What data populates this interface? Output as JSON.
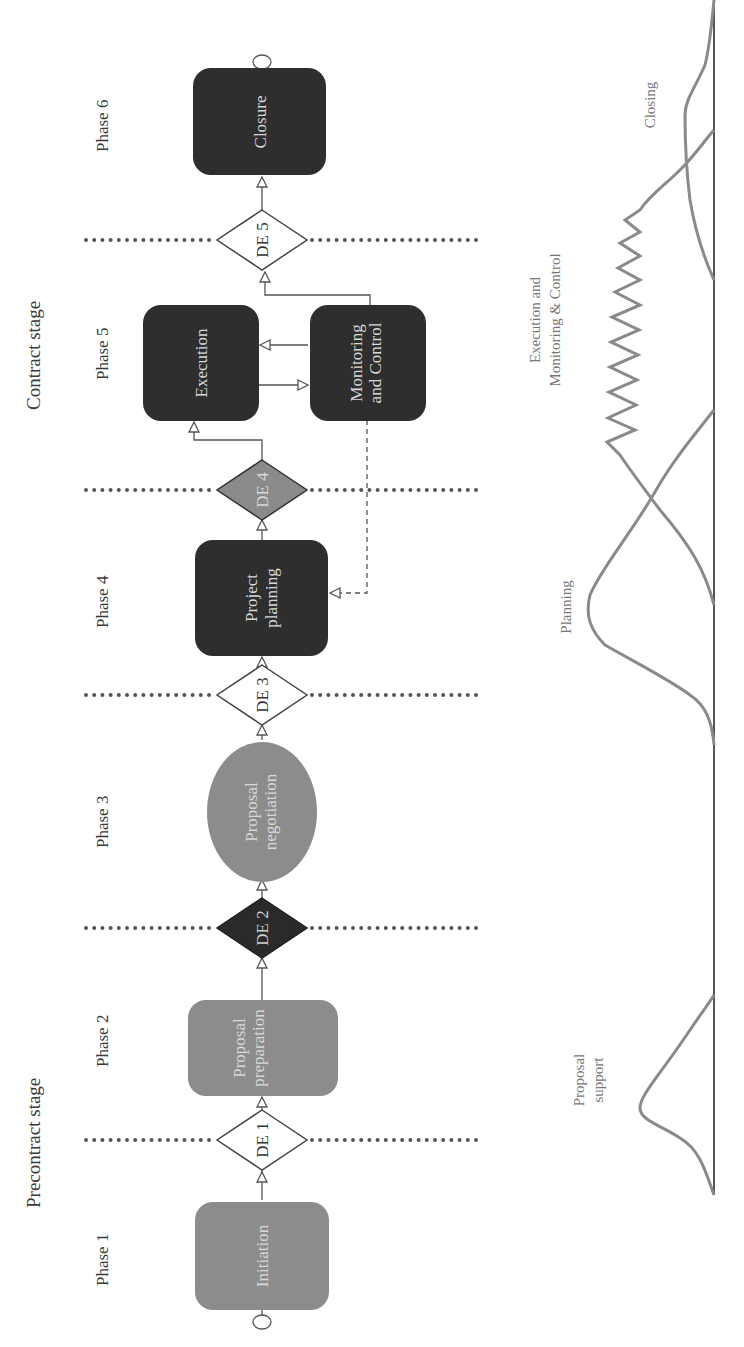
{
  "orientation": "rotated 90deg counterclockwise",
  "stages": {
    "precontract": "Precontract stage",
    "contract": "Contract stage"
  },
  "phases": [
    "Phase 1",
    "Phase 2",
    "Phase 3",
    "Phase 4",
    "Phase 5",
    "Phase 6"
  ],
  "nodes": {
    "initiation": "Initiation",
    "proposal_preparation": [
      "Proposal",
      "preparation"
    ],
    "proposal_negotiation": [
      "Proposal",
      "negotiation"
    ],
    "project_planning": [
      "Project",
      "planning"
    ],
    "execution": "Execution",
    "monitoring_control": [
      "Monitoring",
      "and Control"
    ],
    "closure": "Closure"
  },
  "decisions": [
    "DE 1",
    "DE 2",
    "DE 3",
    "DE 4",
    "DE 5"
  ],
  "decision_styles": {
    "DE 1": "white",
    "DE 2": "black",
    "DE 3": "white",
    "DE 4": "gray",
    "DE 5": "white"
  },
  "colors": {
    "light_gray_node": "#8c8c8c",
    "dark_node": "#2e2e2e",
    "gray_diamond": "#8a8a8a",
    "curve": "#8a8a8a",
    "line": "#555555"
  },
  "effort_curves": {
    "proposal_support": [
      "Proposal",
      "support"
    ],
    "planning": "Planning",
    "execution_monitoring": [
      "Execution and",
      "Monitoring & Control"
    ],
    "closing": "Closing"
  }
}
